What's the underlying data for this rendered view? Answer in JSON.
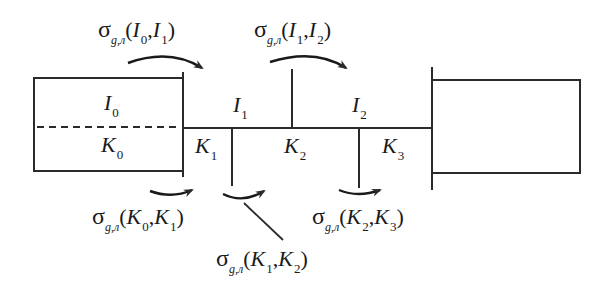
{
  "diagram": {
    "regions": [
      {
        "id": "I0",
        "symbol": "I",
        "index": "0"
      },
      {
        "id": "K0",
        "symbol": "K",
        "index": "0"
      },
      {
        "id": "I1",
        "symbol": "I",
        "index": "1"
      },
      {
        "id": "K1",
        "symbol": "K",
        "index": "1"
      },
      {
        "id": "K2",
        "symbol": "K",
        "index": "2"
      },
      {
        "id": "I2",
        "symbol": "I",
        "index": "2"
      },
      {
        "id": "K3",
        "symbol": "K",
        "index": "3"
      }
    ],
    "transitions": {
      "t_I0_I1": {
        "sigma": "σ",
        "sub": "g,л",
        "open": "(",
        "a": "I",
        "ai": "0",
        "comma": ",",
        "b": "I",
        "bi": "1",
        "close": ")"
      },
      "t_I1_I2": {
        "sigma": "σ",
        "sub": "g,л",
        "open": "(",
        "a": "I",
        "ai": "1",
        "comma": ",",
        "b": "I",
        "bi": "2",
        "close": ")"
      },
      "t_K0_K1": {
        "sigma": "σ",
        "sub": "g,л",
        "open": "(",
        "a": "K",
        "ai": "0",
        "comma": ",",
        "b": "K",
        "bi": "1",
        "close": ")"
      },
      "t_K1_K2": {
        "sigma": "σ",
        "sub": "g,л",
        "open": "(",
        "a": "K",
        "ai": "1",
        "comma": ",",
        "b": "K",
        "bi": "2",
        "close": ")"
      },
      "t_K2_K3": {
        "sigma": "σ",
        "sub": "g,л",
        "open": "(",
        "a": "K",
        "ai": "2",
        "comma": ",",
        "b": "K",
        "bi": "3",
        "close": ")"
      }
    },
    "colors": {
      "line": "#2a2a2a",
      "background": "#ffffff"
    }
  }
}
